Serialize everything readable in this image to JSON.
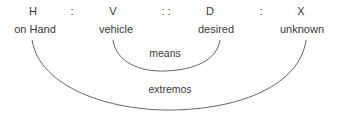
{
  "diagram": {
    "symbols": [
      {
        "text": "H",
        "x": 33
      },
      {
        "text": ":",
        "x": 72
      },
      {
        "text": "V",
        "x": 113
      },
      {
        "text": ": :",
        "x": 166
      },
      {
        "text": "D",
        "x": 210
      },
      {
        "text": ":",
        "x": 261
      },
      {
        "text": "X",
        "x": 301
      }
    ],
    "words": [
      {
        "text": "on Hand",
        "x": 35
      },
      {
        "text": "vehicle",
        "x": 116
      },
      {
        "text": "desired",
        "x": 216
      },
      {
        "text": "unknown",
        "x": 302
      }
    ],
    "arcs": {
      "inner": {
        "label": "means",
        "from": "vehicle",
        "to": "desired"
      },
      "outer": {
        "label": "extremos",
        "from": "on Hand",
        "to": "unknown"
      }
    },
    "stroke_color": "#555555",
    "text_color": "#3a3a3a"
  }
}
